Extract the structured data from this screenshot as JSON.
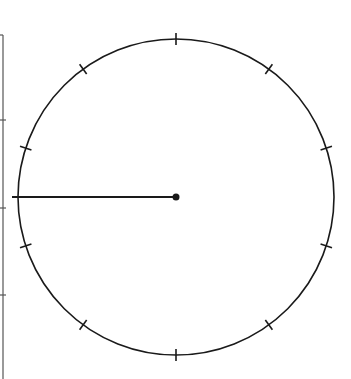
{
  "diagram": {
    "type": "dial",
    "center": [
      176,
      197
    ],
    "radius": 158,
    "tick_count": 10,
    "tick_angles_deg": [
      18,
      54,
      90,
      126,
      162,
      198,
      234,
      270,
      306,
      342
    ],
    "hand_angle_deg": 180,
    "stroke_color": "#1a1a1a",
    "left_scale": {
      "x": 3,
      "y_start": 35,
      "y_end": 379,
      "ticks_y": [
        120,
        208,
        295
      ],
      "color": "#555555"
    }
  }
}
